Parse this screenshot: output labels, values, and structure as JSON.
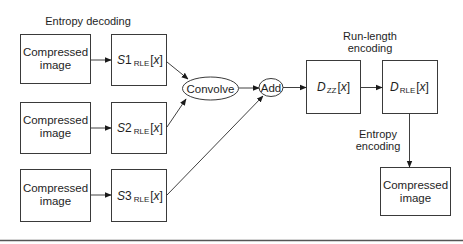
{
  "diagram": {
    "title_labels": {
      "entropy_decoding": "Entropy decoding",
      "run_length_line1": "Run-length",
      "run_length_line2": "encoding",
      "entropy_encoding_line1": "Entropy",
      "entropy_encoding_line2": "encoding"
    },
    "inputs": [
      {
        "line1": "Compressed",
        "line2": "image"
      },
      {
        "line1": "Compressed",
        "line2": "image"
      },
      {
        "line1": "Compressed",
        "line2": "image"
      }
    ],
    "signals": [
      {
        "var": "S",
        "num": "1",
        "sub": "RLE",
        "open": "[",
        "arg": "x",
        "close": "]"
      },
      {
        "var": "S",
        "num": "2",
        "sub": "RLE",
        "open": "[",
        "arg": "x",
        "close": "]"
      },
      {
        "var": "S",
        "num": "3",
        "sub": "RLE",
        "open": "[",
        "arg": "x",
        "close": "]"
      }
    ],
    "operations": {
      "convolve": "Convolve",
      "add": "Add"
    },
    "dzz": {
      "var": "D",
      "sub": "ZZ",
      "open": "[",
      "arg": "x",
      "close": "]"
    },
    "drle": {
      "var": "D",
      "sub": "RLE",
      "open": "[",
      "arg": "x",
      "close": "]"
    },
    "output": {
      "line1": "Compressed",
      "line2": "image"
    },
    "edges": [
      {
        "from": "input-1",
        "to": "s1"
      },
      {
        "from": "input-2",
        "to": "s2"
      },
      {
        "from": "input-3",
        "to": "s3"
      },
      {
        "from": "s1",
        "to": "convolve"
      },
      {
        "from": "s2",
        "to": "convolve"
      },
      {
        "from": "convolve",
        "to": "add"
      },
      {
        "from": "s3",
        "to": "add"
      },
      {
        "from": "add",
        "to": "dzz"
      },
      {
        "from": "dzz",
        "to": "drle"
      },
      {
        "from": "drle",
        "to": "output"
      }
    ],
    "colors": {
      "stroke": "#3a3a3a",
      "text": "#1e1e1e",
      "background": "#ffffff"
    }
  }
}
